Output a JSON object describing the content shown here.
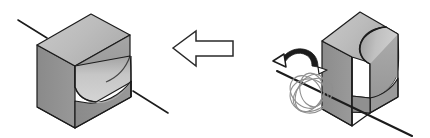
{
  "figure": {
    "type": "isometric-technical-diagram",
    "background_color": "#ffffff",
    "stroke_color": "#1a1a1a",
    "width": 430,
    "height": 138
  },
  "palette": {
    "face_top_light": "#c2c2c2",
    "face_top_mid": "#b4b4b4",
    "face_front_dark": "#8d8d8d",
    "face_side_mid": "#9f9f9f",
    "face_slot_light": "#cdcdcd",
    "face_slot_shadow": "#a8a8a8",
    "outline": "#1c1c1c",
    "arrow_fill": "#ffffff",
    "arrow_stroke": "#2a2a2a",
    "coil_stroke": "#8a8a8a"
  },
  "objects": {
    "left_block": {
      "name": "result-block",
      "label": "Block after rotation (front view of slot)",
      "leader_lines": 2
    },
    "right_block": {
      "name": "source-block",
      "label": "Block before rotation",
      "leader_lines": 1
    },
    "transform_arrow": {
      "name": "transform-arrow",
      "direction": "left",
      "style": "outline-block-arrow"
    },
    "rotation_indicator": {
      "name": "rotation-arrow",
      "direction": "counter-clockwise",
      "style": "curved-arrow"
    },
    "rotation_axis": {
      "name": "rotation-axis-line",
      "style": "solid-diagonal"
    },
    "rotation_coil": {
      "name": "rotation-coil",
      "style": "looped-spiral-about-axis",
      "loops": 5
    }
  }
}
